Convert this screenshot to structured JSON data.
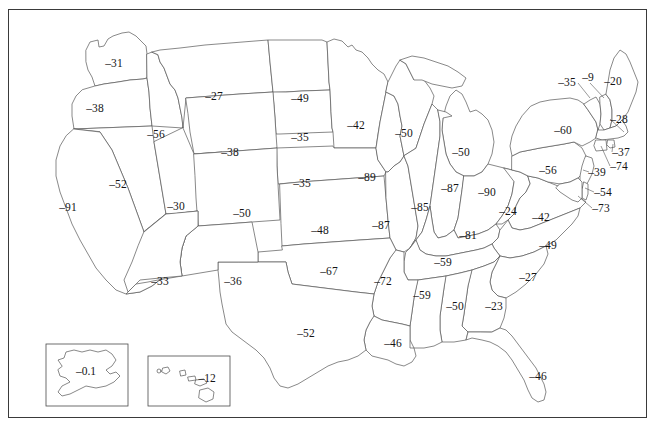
{
  "figure": {
    "type": "choropleth-label-map",
    "region": "United States",
    "frame": true,
    "background_color": "#ffffff",
    "outline_color": "#565656",
    "label_color": "#151515"
  },
  "chart_data": {
    "type": "map",
    "title": "",
    "xlabel": "",
    "ylabel": "",
    "legend": [],
    "grid": false,
    "labels": [
      {
        "code": "WA",
        "name": "Washington",
        "value": "–31",
        "x": 114,
        "y": 63
      },
      {
        "code": "OR",
        "name": "Oregon",
        "value": "–38",
        "x": 95,
        "y": 108
      },
      {
        "code": "ID",
        "name": "Idaho",
        "value": "–56",
        "x": 156,
        "y": 134
      },
      {
        "code": "MT",
        "name": "Montana",
        "value": "–27",
        "x": 214,
        "y": 96
      },
      {
        "code": "ND",
        "name": "North Dakota",
        "value": "–49",
        "x": 300,
        "y": 98
      },
      {
        "code": "WY",
        "name": "Wyoming",
        "value": "–38",
        "x": 230,
        "y": 152
      },
      {
        "code": "SD",
        "name": "South Dakota",
        "value": "–35",
        "x": 300,
        "y": 137
      },
      {
        "code": "MN",
        "name": "Minnesota",
        "value": "–42",
        "x": 356,
        "y": 125
      },
      {
        "code": "NE",
        "name": "Nebraska",
        "value": "–35",
        "x": 302,
        "y": 183
      },
      {
        "code": "IA",
        "name": "Iowa",
        "value": "–89",
        "x": 367,
        "y": 177
      },
      {
        "code": "WI",
        "name": "Wisconsin",
        "value": "–50",
        "x": 404,
        "y": 133
      },
      {
        "code": "MI",
        "name": "Michigan",
        "value": "–50",
        "x": 461,
        "y": 152
      },
      {
        "code": "NV",
        "name": "Nevada",
        "value": "–52",
        "x": 118,
        "y": 184
      },
      {
        "code": "CA",
        "name": "California",
        "value": "–91",
        "x": 68,
        "y": 207
      },
      {
        "code": "UT",
        "name": "Utah",
        "value": "–30",
        "x": 176,
        "y": 206
      },
      {
        "code": "CO",
        "name": "Colorado",
        "value": "–50",
        "x": 242,
        "y": 213
      },
      {
        "code": "KS",
        "name": "Kansas",
        "value": "–48",
        "x": 320,
        "y": 230
      },
      {
        "code": "MO",
        "name": "Missouri",
        "value": "–87",
        "x": 381,
        "y": 225
      },
      {
        "code": "IL",
        "name": "Illinois",
        "value": "–85",
        "x": 420,
        "y": 207
      },
      {
        "code": "IN",
        "name": "Indiana",
        "value": "–87",
        "x": 450,
        "y": 188
      },
      {
        "code": "OH",
        "name": "Ohio",
        "value": "–90",
        "x": 487,
        "y": 192
      },
      {
        "code": "KY",
        "name": "Kentucky",
        "value": "–81",
        "x": 468,
        "y": 235
      },
      {
        "code": "WV",
        "name": "West Virginia",
        "value": "–24",
        "x": 508,
        "y": 211
      },
      {
        "code": "VA",
        "name": "Virginia",
        "value": "–42",
        "x": 541,
        "y": 217
      },
      {
        "code": "PA",
        "name": "Pennsylvania",
        "value": "–56",
        "x": 548,
        "y": 170
      },
      {
        "code": "NY",
        "name": "New York",
        "value": "–60",
        "x": 563,
        "y": 130
      },
      {
        "code": "VT",
        "name": "Vermont",
        "value": "–35",
        "x": 567,
        "y": 82
      },
      {
        "code": "NH",
        "name": "New Hampshire",
        "value": "–9",
        "x": 588,
        "y": 77
      },
      {
        "code": "ME",
        "name": "Maine",
        "value": "–20",
        "x": 613,
        "y": 81
      },
      {
        "code": "MA",
        "name": "Massachusetts",
        "value": "–28",
        "x": 619,
        "y": 119
      },
      {
        "code": "RI",
        "name": "Rhode Island",
        "value": "–37",
        "x": 621,
        "y": 152
      },
      {
        "code": "CT",
        "name": "Connecticut",
        "value": "–74",
        "x": 619,
        "y": 166
      },
      {
        "code": "NJ",
        "name": "New Jersey",
        "value": "–39",
        "x": 597,
        "y": 172
      },
      {
        "code": "DE",
        "name": "Delaware",
        "value": "–54",
        "x": 603,
        "y": 192
      },
      {
        "code": "MD",
        "name": "Maryland",
        "value": "–73",
        "x": 601,
        "y": 208
      },
      {
        "code": "NC",
        "name": "North Carolina",
        "value": "–49",
        "x": 548,
        "y": 245
      },
      {
        "code": "TN",
        "name": "Tennessee",
        "value": "–59",
        "x": 443,
        "y": 262
      },
      {
        "code": "SC",
        "name": "South Carolina",
        "value": "–27",
        "x": 528,
        "y": 277
      },
      {
        "code": "GA",
        "name": "Georgia",
        "value": "–23",
        "x": 494,
        "y": 306
      },
      {
        "code": "AL",
        "name": "Alabama",
        "value": "–50",
        "x": 455,
        "y": 306
      },
      {
        "code": "MS",
        "name": "Mississippi",
        "value": "–59",
        "x": 422,
        "y": 295
      },
      {
        "code": "AR",
        "name": "Arkansas",
        "value": "–72",
        "x": 383,
        "y": 281
      },
      {
        "code": "LA",
        "name": "Louisiana",
        "value": "–46",
        "x": 393,
        "y": 343
      },
      {
        "code": "OK",
        "name": "Oklahoma",
        "value": "–67",
        "x": 329,
        "y": 271
      },
      {
        "code": "TX",
        "name": "Texas",
        "value": "–52",
        "x": 306,
        "y": 333
      },
      {
        "code": "NM",
        "name": "New Mexico",
        "value": "–36",
        "x": 233,
        "y": 281
      },
      {
        "code": "AZ",
        "name": "Arizona",
        "value": "–33",
        "x": 160,
        "y": 281
      },
      {
        "code": "FL",
        "name": "Florida",
        "value": "–46",
        "x": 538,
        "y": 376
      }
    ],
    "insets": [
      {
        "code": "AK",
        "name": "Alaska",
        "value": "–0.1",
        "x": 86,
        "y": 371
      },
      {
        "code": "HI",
        "name": "Hawaii",
        "value": "–12",
        "x": 207,
        "y": 378
      }
    ],
    "value_range": [
      -91,
      -0.1
    ],
    "units": ""
  }
}
